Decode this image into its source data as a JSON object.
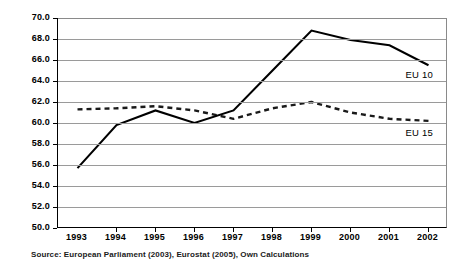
{
  "chart_data": {
    "type": "line",
    "title": "",
    "subtitle": "",
    "xlabel": "",
    "ylabel": "",
    "categories": [
      "1993",
      "1994",
      "1995",
      "1996",
      "1997",
      "1998",
      "1999",
      "2000",
      "2001",
      "2002"
    ],
    "x": [
      1993,
      1994,
      1995,
      1996,
      1997,
      1998,
      1999,
      2000,
      2001,
      2002
    ],
    "ylim": [
      50.0,
      70.0
    ],
    "ytick_step": 2.0,
    "yticks": [
      "70.0",
      "68.0",
      "66.0",
      "64.0",
      "62.0",
      "60.0",
      "58.0",
      "56.0",
      "54.0",
      "52.0",
      "50.0"
    ],
    "ytick_values": [
      70.0,
      68.0,
      66.0,
      64.0,
      62.0,
      60.0,
      58.0,
      56.0,
      54.0,
      52.0,
      50.0
    ],
    "grid": true,
    "grid_axis": "y",
    "legend": "inline-end-labels",
    "series": [
      {
        "name": "EU 10",
        "style": "solid",
        "color": "#000000",
        "values": [
          55.7,
          59.8,
          61.2,
          60.0,
          61.2,
          65.0,
          68.8,
          67.9,
          67.4,
          65.5
        ]
      },
      {
        "name": "EU 15",
        "style": "dotted",
        "color": "#1a1a1a",
        "values": [
          61.3,
          61.4,
          61.6,
          61.2,
          60.4,
          61.4,
          62.0,
          61.0,
          60.4,
          60.2
        ]
      }
    ],
    "annotations": [
      {
        "text": "EU 10",
        "series": "EU 10",
        "position": "right-end-below"
      },
      {
        "text": "EU 15",
        "series": "EU 15",
        "position": "right-end-below"
      }
    ],
    "source": "Source: European Parliament (2003), Eurostat (2005), Own Calculations"
  },
  "labels": {
    "eu10": "EU 10",
    "eu15": "EU 15"
  }
}
